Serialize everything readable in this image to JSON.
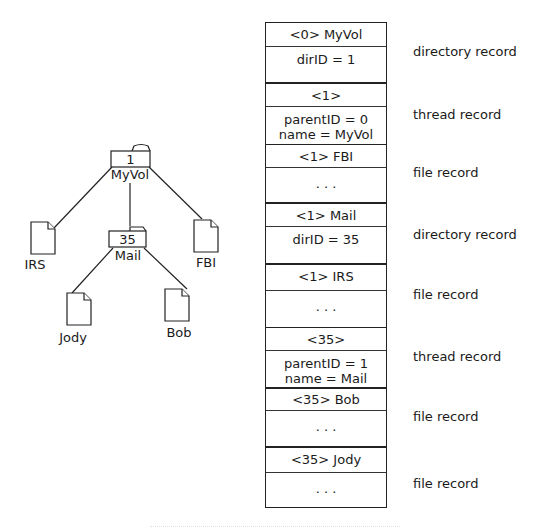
{
  "tree": {
    "root": {
      "id_label": "1",
      "name": "MyVol",
      "type": "folder"
    },
    "children": [
      {
        "name": "IRS",
        "type": "file"
      },
      {
        "id_label": "35",
        "name": "Mail",
        "type": "folder",
        "children": [
          {
            "name": "Jody",
            "type": "file"
          },
          {
            "name": "Bob",
            "type": "file"
          }
        ]
      },
      {
        "name": "FBI",
        "type": "file"
      }
    ]
  },
  "catalog": {
    "records": [
      {
        "key": "<0> MyVol",
        "body": [
          "dirID = 1"
        ],
        "type_label": "directory record"
      },
      {
        "key": "<1>",
        "body": [
          "parentID = 0",
          "name = MyVol"
        ],
        "type_label": "thread record"
      },
      {
        "key": "<1> FBI",
        "body": [
          "· · ·"
        ],
        "type_label": "file record"
      },
      {
        "key": "<1> Mail",
        "body": [
          "dirID = 35"
        ],
        "type_label": "directory record"
      },
      {
        "key": "<1> IRS",
        "body": [
          "· · ·"
        ],
        "type_label": "file record"
      },
      {
        "key": "<35>",
        "body": [
          "parentID = 1",
          "name = Mail"
        ],
        "type_label": "thread record"
      },
      {
        "key": "<35> Bob",
        "body": [
          "· · ·"
        ],
        "type_label": "file record"
      },
      {
        "key": "<35> Jody",
        "body": [
          "· · ·"
        ],
        "type_label": "file record"
      }
    ]
  }
}
